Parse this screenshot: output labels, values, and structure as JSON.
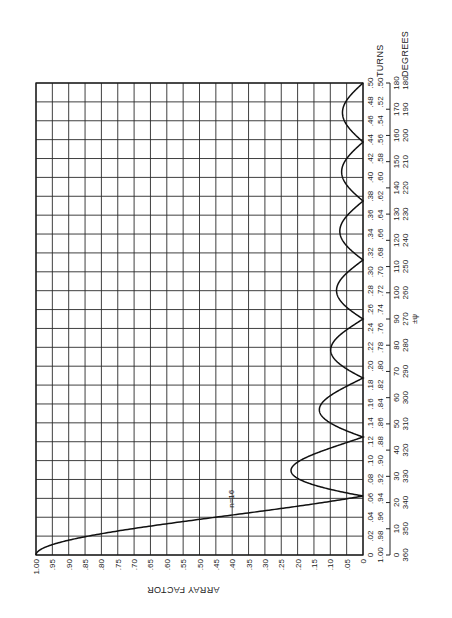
{
  "chart_data": {
    "type": "line",
    "orientation": "rotated-90-ccw",
    "title": "",
    "series": [
      {
        "name": "n=16",
        "label": "n=16",
        "formula": "|sin(n*pi*t)/(n*sin(pi*t))|, t in turns",
        "n": 16,
        "x_turns": [
          0,
          0.0625,
          0.09,
          0.125,
          0.152,
          0.1875,
          0.215,
          0.25,
          0.279,
          0.3125,
          0.343,
          0.375,
          0.406,
          0.4375,
          0.469,
          0.5
        ],
        "y": [
          1.0,
          0,
          0.22,
          0,
          0.13,
          0,
          0.09,
          0,
          0.075,
          0,
          0.066,
          0,
          0.064,
          0,
          0.0625,
          0
        ]
      }
    ],
    "ylabel": "ARRAY FACTOR",
    "ylim": [
      0,
      1.0
    ],
    "y_ticks": [
      "1.00",
      ".95",
      ".90",
      ".85",
      ".80",
      ".75",
      ".70",
      ".65",
      ".60",
      ".55",
      ".50",
      ".45",
      ".40",
      ".35",
      ".30",
      ".25",
      ".20",
      ".15",
      ".10",
      ".05",
      "0"
    ],
    "xlabel_turns": "TURNS",
    "xlabel_degrees": "DEGREES",
    "xlabel_psi": "±ψ",
    "xlim_turns": [
      0,
      0.5
    ],
    "x_ticks_turns": [
      "0",
      ".02",
      ".04",
      ".06",
      ".08",
      ".10",
      ".12",
      ".14",
      ".16",
      ".18",
      ".20",
      ".22",
      ".24",
      ".26",
      ".28",
      ".30",
      ".32",
      ".34",
      ".36",
      ".38",
      ".40",
      ".42",
      ".44",
      ".46",
      ".48",
      ".50"
    ],
    "x_ticks_turns_complement": [
      "1.00",
      ".98",
      ".96",
      ".94",
      ".92",
      ".90",
      ".88",
      ".86",
      ".84",
      ".82",
      ".80",
      ".78",
      ".76",
      ".74",
      ".72",
      ".70",
      ".68",
      ".66",
      ".64",
      ".62",
      ".60",
      ".58",
      ".56",
      ".54",
      ".52",
      ".50"
    ],
    "x_ticks_degrees": [
      "0",
      "10",
      "20",
      "30",
      "40",
      "50",
      "60",
      "70",
      "80",
      "90",
      "100",
      "110",
      "120",
      "130",
      "140",
      "150",
      "160",
      "170",
      "180"
    ],
    "x_ticks_degrees_complement": [
      "360",
      "350",
      "340",
      "330",
      "320",
      "310",
      "300",
      "290",
      "280",
      "270",
      "260",
      "250",
      "240",
      "230",
      "220",
      "210",
      "200",
      "190",
      "180"
    ],
    "grid": true,
    "legend": "none (inline label n=16)"
  }
}
